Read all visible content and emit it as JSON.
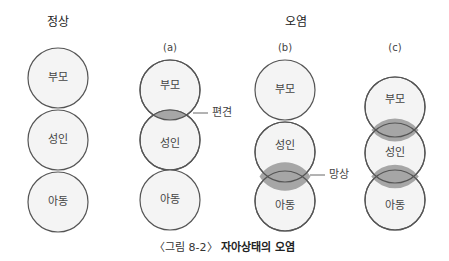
{
  "headers": {
    "normal": "정상",
    "contaminated": "오염"
  },
  "subheaders": {
    "a": "(a)",
    "b": "(b)",
    "c": "(c)"
  },
  "ego_states": {
    "parent": "부모",
    "adult": "성인",
    "child": "아동"
  },
  "annotations": {
    "prejudice": "편견",
    "delusion": "망상"
  },
  "caption": {
    "number": "〈그림 8-2〉",
    "title": "자아상태의 오염"
  },
  "colors": {
    "circle_fill": "#f4f4f4",
    "circle_stroke": "#555555",
    "overlap_fill": "#a6a6a6"
  }
}
